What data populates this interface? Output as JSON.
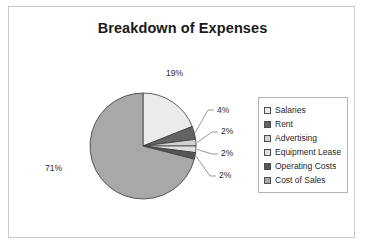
{
  "chart_data": {
    "type": "pie",
    "title": "Breakdown of Expenses",
    "categories": [
      "Salaries",
      "Rent",
      "Advertising",
      "Equipment Lease",
      "Operating Costs",
      "Cost of Sales"
    ],
    "values": [
      19,
      4,
      2,
      2,
      2,
      71
    ],
    "value_labels": [
      "19%",
      "4%",
      "2%",
      "2%",
      "2%",
      "71%"
    ],
    "unit": "%",
    "colors": [
      "#ebebeb",
      "#636363",
      "#d2d2d2",
      "#e0e0e0",
      "#555555",
      "#a8a8a8"
    ],
    "slice_border_color": "#3c3c3c",
    "start_angle_deg": 0,
    "direction": "clockwise",
    "legend_position": "right",
    "grid": false,
    "xlabel": "",
    "ylabel": "",
    "data_labels_shown": true,
    "leader_lines": true
  },
  "chart": {
    "title": "Breakdown of Expenses",
    "frame_color": "#c9c9c9",
    "background": "#ffffff"
  },
  "labels": {
    "salaries_pct": "19%",
    "rent_pct": "4%",
    "advertising_pct": "2%",
    "equipment_lease_pct": "2%",
    "operating_costs_pct": "2%",
    "cost_of_sales_pct": "71%"
  },
  "legend": {
    "items": [
      {
        "label": "Salaries",
        "color": "#ebebeb"
      },
      {
        "label": "Rent",
        "color": "#636363"
      },
      {
        "label": "Advertising",
        "color": "#d2d2d2"
      },
      {
        "label": "Equipment Lease",
        "color": "#e0e0e0"
      },
      {
        "label": "Operating Costs",
        "color": "#555555"
      },
      {
        "label": "Cost of Sales",
        "color": "#a8a8a8"
      }
    ]
  }
}
